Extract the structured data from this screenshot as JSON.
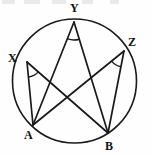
{
  "figure": {
    "width": 151,
    "height": 156,
    "background_color": "#fefefe",
    "stroke_color": "#1a1a1a",
    "label_color": "#111111",
    "circle": {
      "name": "circumscribed-circle",
      "center_x": 74.5,
      "center_y": 81,
      "radius": 62,
      "stroke_width": 1.6
    },
    "points": [
      {
        "id": "X",
        "label": "X",
        "x": 27,
        "y": 62,
        "label_x": 8,
        "label_y": 52
      },
      {
        "id": "Y",
        "label": "Y",
        "x": 74,
        "y": 22,
        "label_x": 70,
        "label_y": 2
      },
      {
        "id": "Z",
        "label": "Z",
        "x": 124,
        "y": 51,
        "label_x": 128,
        "label_y": 36
      },
      {
        "id": "A",
        "label": "A",
        "x": 33,
        "y": 125,
        "label_x": 24,
        "label_y": 129
      },
      {
        "id": "B",
        "label": "B",
        "x": 108,
        "y": 133,
        "label_x": 105,
        "label_y": 140
      }
    ],
    "chords": [
      {
        "name": "chord-X-A",
        "from": "X",
        "to": "A"
      },
      {
        "name": "chord-X-B",
        "from": "X",
        "to": "B"
      },
      {
        "name": "chord-Y-A",
        "from": "Y",
        "to": "A"
      },
      {
        "name": "chord-Y-B",
        "from": "Y",
        "to": "B"
      },
      {
        "name": "chord-Z-A",
        "from": "Z",
        "to": "A"
      },
      {
        "name": "chord-Z-B",
        "from": "Z",
        "to": "B"
      }
    ],
    "angle_marks": [
      {
        "name": "angle-arc-at-X",
        "vertex": "X",
        "to_a": "A",
        "to_b": "B",
        "radius": 15
      },
      {
        "name": "angle-arc-at-Y",
        "vertex": "Y",
        "to_a": "A",
        "to_b": "B",
        "radius": 18
      },
      {
        "name": "angle-arc-at-Z",
        "vertex": "Z",
        "to_a": "A",
        "to_b": "B",
        "radius": 16
      }
    ],
    "top_artifacts": [
      {
        "left": 2,
        "width": 13
      },
      {
        "left": 24,
        "width": 16
      },
      {
        "left": 52,
        "width": 14
      },
      {
        "left": 82,
        "width": 11
      },
      {
        "left": 110,
        "width": 9
      }
    ]
  }
}
